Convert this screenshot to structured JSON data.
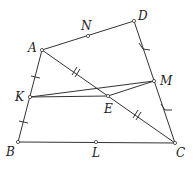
{
  "diagram": {
    "type": "geometry",
    "points": {
      "A": {
        "label": "A",
        "x": 42,
        "y": 50
      },
      "D": {
        "label": "D",
        "x": 134,
        "y": 21
      },
      "N": {
        "label": "N",
        "x": 88,
        "y": 36
      },
      "M": {
        "label": "M",
        "x": 154,
        "y": 81
      },
      "K": {
        "label": "K",
        "x": 30,
        "y": 97
      },
      "E": {
        "label": "E",
        "x": 108,
        "y": 96
      },
      "B": {
        "label": "B",
        "x": 18,
        "y": 142
      },
      "L": {
        "label": "L",
        "x": 96,
        "y": 142
      },
      "C": {
        "label": "C",
        "x": 175,
        "y": 143
      }
    },
    "segments": [
      [
        "A",
        "D"
      ],
      [
        "D",
        "C"
      ],
      [
        "B",
        "C"
      ],
      [
        "A",
        "B"
      ],
      [
        "A",
        "C"
      ],
      [
        "K",
        "M"
      ],
      [
        "K",
        "E"
      ],
      [
        "E",
        "M"
      ]
    ],
    "equal_marks": {
      "single_ticks": [
        "AK",
        "KB"
      ],
      "double_ticks": [
        "AE",
        "EC"
      ],
      "angle_ticks": [
        "DM",
        "MC"
      ]
    }
  }
}
